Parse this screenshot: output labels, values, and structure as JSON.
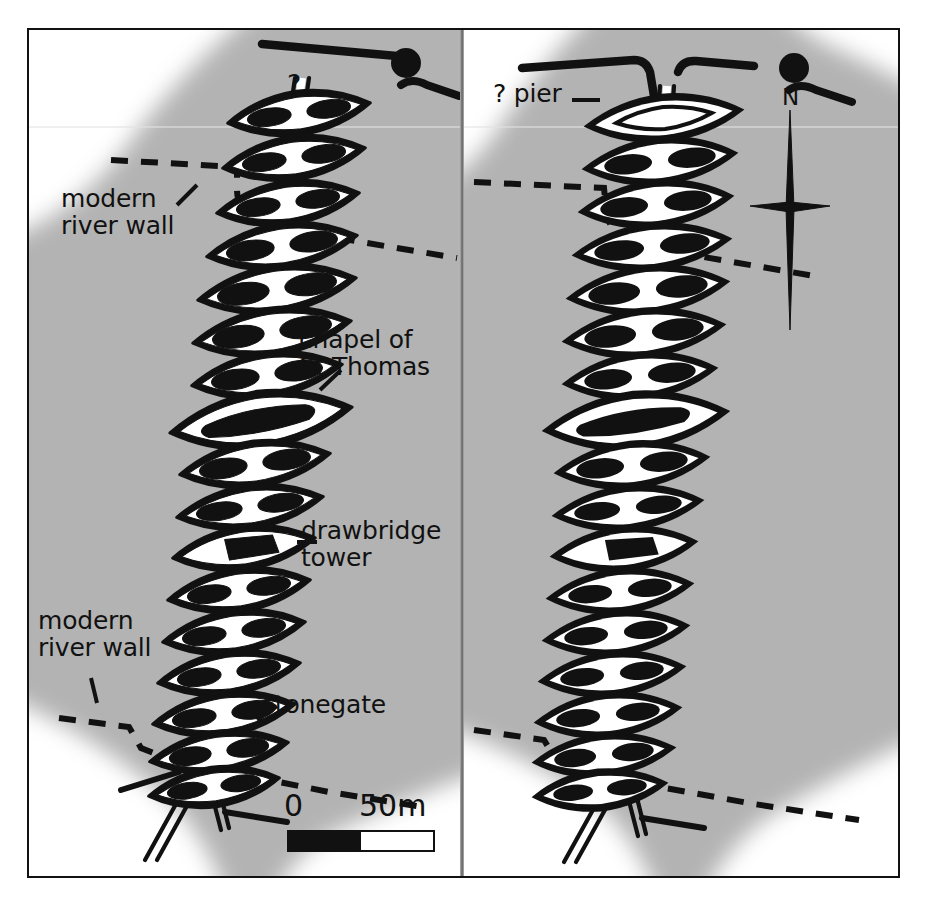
{
  "figure": {
    "kind": "archaeological-plan",
    "panel_count": 2,
    "background_color": "#b3b3b3",
    "ink_color": "#111111",
    "paper_color": "#ffffff"
  },
  "left_panel": {
    "name": "left-plan",
    "pier_count": 21,
    "labels": {
      "question_top": "?",
      "modern_river_wall_upper": "modern\nriver wall",
      "modern_river_wall_lower": "modern\nriver wall",
      "chapel": "chapel of\nSt Thomas",
      "drawbridge": "drawbridge\ntower",
      "stonegate": "stonegate"
    },
    "scale": {
      "zero_label": "0",
      "max_label": "50m",
      "segments": [
        "black",
        "white"
      ]
    }
  },
  "right_panel": {
    "name": "right-plan",
    "pier_count": 21,
    "labels": {
      "pier_query": "? pier"
    },
    "north_arrow": {
      "label": "N"
    }
  },
  "legend_semantics": {
    "solid_outline_shape": "bridge pier / cutwater",
    "dashed_line": "modern river wall",
    "double_line": "bridge deck / carriageway",
    "filled_circle": "mapped point feature"
  }
}
